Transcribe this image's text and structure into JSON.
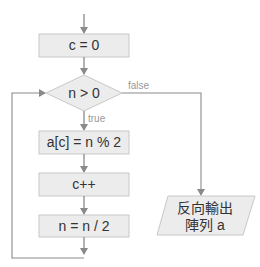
{
  "diagram": {
    "type": "flowchart",
    "colors": {
      "node_fill": "#ececec",
      "node_stroke": "#c8c8c8",
      "edge": "#8a8a8a",
      "text": "#333333",
      "label": "#999999"
    },
    "nodes": {
      "init": {
        "label": "c = 0",
        "shape": "process"
      },
      "cond": {
        "label": "n > 0",
        "shape": "decision"
      },
      "mod": {
        "label": "a[c] = n % 2",
        "shape": "process"
      },
      "inc": {
        "label": "c++",
        "shape": "process"
      },
      "div": {
        "label": "n = n / 2",
        "shape": "process"
      },
      "output": {
        "line1": "反向輸出",
        "line2": "陣列 a",
        "shape": "io"
      }
    },
    "edges": {
      "true_label": "true",
      "false_label": "false"
    }
  }
}
